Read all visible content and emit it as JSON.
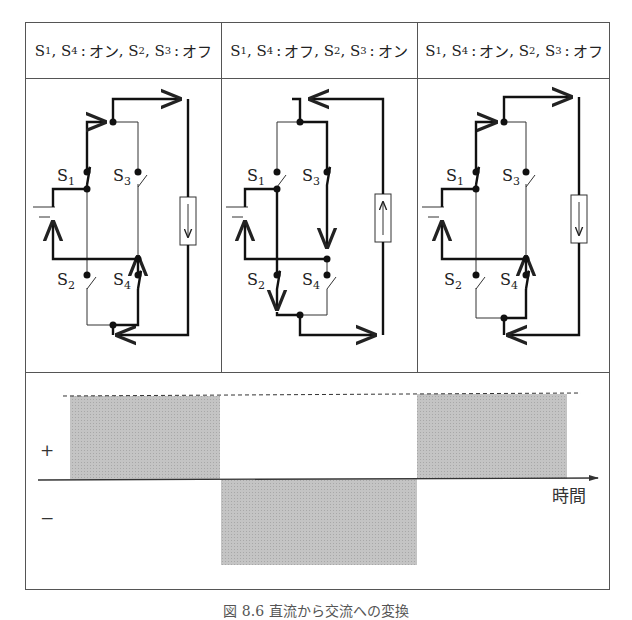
{
  "figure": {
    "caption": "図 8.6 直流から交流への変換"
  },
  "headers": [
    {
      "s1": "S",
      "s1_sub": "1",
      "s4": "S",
      "s4_sub": "4",
      "state_a": "オン",
      "s2": "S",
      "s2_sub": "2",
      "s3": "S",
      "s3_sub": "3",
      "state_b": "オフ"
    },
    {
      "s1": "S",
      "s1_sub": "1",
      "s4": "S",
      "s4_sub": "4",
      "state_a": "オフ",
      "s2": "S",
      "s2_sub": "2",
      "s3": "S",
      "s3_sub": "3",
      "state_b": "オン"
    },
    {
      "s1": "S",
      "s1_sub": "1",
      "s4": "S",
      "s4_sub": "4",
      "state_a": "オン",
      "s2": "S",
      "s2_sub": "2",
      "s3": "S",
      "s3_sub": "3",
      "state_b": "オフ"
    }
  ],
  "circuits": [
    {
      "closed": [
        "S1",
        "S4"
      ],
      "open": [
        "S2",
        "S3"
      ],
      "load_current": "down",
      "labels": {
        "s1": "S1",
        "s2": "S2",
        "s3": "S3",
        "s4": "S4"
      }
    },
    {
      "closed": [
        "S2",
        "S3"
      ],
      "open": [
        "S1",
        "S4"
      ],
      "load_current": "up",
      "labels": {
        "s1": "S1",
        "s2": "S2",
        "s3": "S3",
        "s4": "S4"
      }
    },
    {
      "closed": [
        "S1",
        "S4"
      ],
      "open": [
        "S2",
        "S3"
      ],
      "load_current": "down",
      "labels": {
        "s1": "S1",
        "s2": "S2",
        "s3": "S3",
        "s4": "S4"
      }
    }
  ],
  "switch_labels": {
    "letter": "S",
    "n1": "1",
    "n2": "2",
    "n3": "3",
    "n4": "4"
  },
  "waveform": {
    "plus_label": "+",
    "minus_label": "−",
    "time_axis_label": "時間",
    "segments": [
      {
        "polarity": "+",
        "phase": 1
      },
      {
        "polarity": "−",
        "phase": 2
      },
      {
        "polarity": "+",
        "phase": 3
      }
    ],
    "fill_color": "#bdbdbd",
    "line_color": "#444444"
  }
}
